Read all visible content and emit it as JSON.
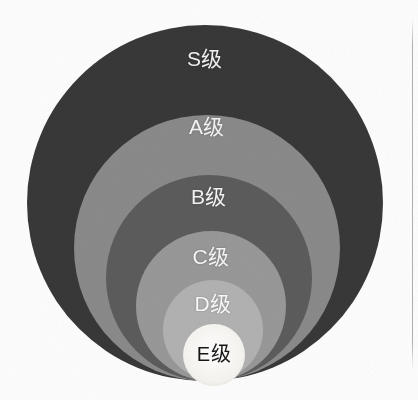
{
  "figure": {
    "background_color": "#fdfdfd",
    "label_color": "#f4f4f4",
    "inner_label_color": "#161616",
    "scan_artifact": "vertical-line-right-edge"
  },
  "chart_data": {
    "type": "pie",
    "title": "",
    "subtitle": "",
    "xlabel": "",
    "ylabel": "",
    "legend_position": "none",
    "grid": false,
    "layout": "nested-concentric-circles-bottom-aligned",
    "categories": [
      "S级",
      "A级",
      "B级",
      "C级",
      "D级",
      "E级"
    ],
    "values": [
      178,
      133,
      103,
      75,
      50,
      31
    ],
    "value_unit": "radius_px",
    "series": [
      {
        "name": "等级半径",
        "values": [
          178,
          133,
          103,
          75,
          50,
          31
        ]
      }
    ],
    "colors": [
      "#383838",
      "#8a8a8a",
      "#5c5c5c",
      "#989898",
      "#b2b2b2",
      "#f4f2ee"
    ],
    "circles": [
      {
        "label": "S级",
        "fill": "#383838",
        "cx": 205,
        "cy": 203,
        "r": 178,
        "label_y": 42,
        "text_color": "#f2f2f2"
      },
      {
        "label": "A级",
        "fill": "#8a8a8a",
        "cx": 207,
        "cy": 248,
        "r": 133,
        "label_y": 110,
        "text_color": "#f4f4f4"
      },
      {
        "label": "B级",
        "fill": "#5c5c5c",
        "cx": 209,
        "cy": 278,
        "r": 103,
        "label_y": 180,
        "text_color": "#f4f4f4"
      },
      {
        "label": "C级",
        "fill": "#989898",
        "cx": 211,
        "cy": 306,
        "r": 75,
        "label_y": 240,
        "text_color": "#f6f6f6"
      },
      {
        "label": "D级",
        "fill": "#b2b2b2",
        "cx": 213,
        "cy": 330,
        "r": 50,
        "label_y": 287,
        "text_color": "#fafafa"
      },
      {
        "label": "E级",
        "fill": "#f4f2ee",
        "cx": 214,
        "cy": 355,
        "r": 31,
        "label_y": 338,
        "text_color": "#161616"
      }
    ],
    "axis_ranges": {
      "x": [
        0,
        418
      ],
      "y": [
        0,
        400
      ]
    }
  }
}
